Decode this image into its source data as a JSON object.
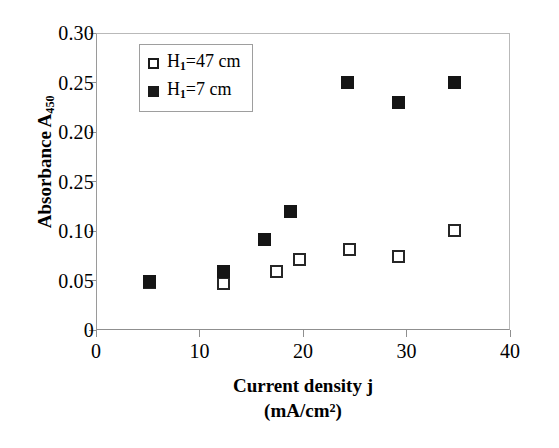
{
  "chart_data": {
    "type": "scatter",
    "title": "",
    "xlabel": "Current density j (mA/cm2)",
    "xlabel_line1": "Current density j",
    "xlabel_line2_prefix": "(mA/cm",
    "xlabel_line2_sup": "2",
    "xlabel_line2_suffix": ")",
    "ylabel": "Absorbance A450",
    "ylabel_prefix": "Absorbance  A",
    "ylabel_sub": "450",
    "xlim": [
      0,
      40
    ],
    "ylim": [
      0,
      0.3
    ],
    "grid": false,
    "legend_position": "top-left inside",
    "x_ticks": [
      {
        "value": 0,
        "label": "0"
      },
      {
        "value": 10,
        "label": "10"
      },
      {
        "value": 20,
        "label": "20"
      },
      {
        "value": 30,
        "label": "30"
      },
      {
        "value": 40,
        "label": "40"
      }
    ],
    "y_ticks": [
      {
        "value": 0.3,
        "label": "0.30"
      },
      {
        "value": 0.25,
        "label": "0.25"
      },
      {
        "value": 0.2,
        "label": "0.20"
      },
      {
        "value": 0.15,
        "label": "0.25"
      },
      {
        "value": 0.1,
        "label": "0.10"
      },
      {
        "value": 0.05,
        "label": "0.05"
      },
      {
        "value": 0.0,
        "label": "0"
      }
    ],
    "series": [
      {
        "name": "H1=47 cm",
        "legend_prefix": "H",
        "legend_sub": "1",
        "legend_suffix": "=47 cm",
        "marker": "open-square",
        "color": "#262626",
        "points": [
          {
            "x": 5.2,
            "y": 0.048
          },
          {
            "x": 12.3,
            "y": 0.047
          },
          {
            "x": 17.4,
            "y": 0.059
          },
          {
            "x": 19.7,
            "y": 0.071
          },
          {
            "x": 24.5,
            "y": 0.081
          },
          {
            "x": 29.2,
            "y": 0.074
          },
          {
            "x": 34.6,
            "y": 0.101
          }
        ]
      },
      {
        "name": "H1=7 cm",
        "legend_prefix": "H",
        "legend_sub": "1",
        "legend_suffix": "=7 cm",
        "marker": "filled-square",
        "color": "#151515",
        "points": [
          {
            "x": 5.2,
            "y": 0.049
          },
          {
            "x": 12.3,
            "y": 0.059
          },
          {
            "x": 16.3,
            "y": 0.091
          },
          {
            "x": 18.8,
            "y": 0.12
          },
          {
            "x": 24.3,
            "y": 0.25
          },
          {
            "x": 29.2,
            "y": 0.23
          },
          {
            "x": 34.6,
            "y": 0.25
          }
        ]
      }
    ]
  }
}
